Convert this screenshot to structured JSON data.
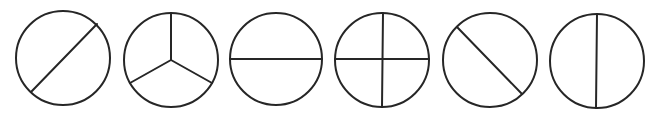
{
  "figure": {
    "background": "#ffffff",
    "stroke_color": "#262626",
    "stroke_width": 2
  },
  "circles": [
    {
      "id": "circle-1",
      "label": "circle divided by diagonal line (bottom-left to top-right), not through center",
      "cx": 63,
      "cy": 58,
      "r": 47,
      "lines": [
        {
          "x1": 31,
          "y1": 92,
          "x2": 97,
          "y2": 24
        }
      ]
    },
    {
      "id": "circle-2",
      "label": "circle divided into three equal parts",
      "cx": 171,
      "cy": 60,
      "r": 47,
      "lines": [
        {
          "x1": 171,
          "y1": 60,
          "x2": 171,
          "y2": 13
        },
        {
          "x1": 171,
          "y1": 60,
          "x2": 130,
          "y2": 83
        },
        {
          "x1": 171,
          "y1": 60,
          "x2": 212,
          "y2": 83
        }
      ]
    },
    {
      "id": "circle-3",
      "label": "circle divided in half by horizontal line",
      "cx": 276,
      "cy": 59,
      "r": 46,
      "lines": [
        {
          "x1": 230,
          "y1": 59,
          "x2": 322,
          "y2": 59
        }
      ]
    },
    {
      "id": "circle-4",
      "label": "circle divided into four equal parts",
      "cx": 382,
      "cy": 60,
      "r": 47,
      "lines": [
        {
          "x1": 335,
          "y1": 59,
          "x2": 429,
          "y2": 59
        },
        {
          "x1": 383,
          "y1": 13,
          "x2": 382,
          "y2": 107
        }
      ]
    },
    {
      "id": "circle-5",
      "label": "circle divided by diagonal line (top-left to bottom-right), not through center",
      "cx": 490,
      "cy": 60,
      "r": 47,
      "lines": [
        {
          "x1": 457,
          "y1": 27,
          "x2": 522,
          "y2": 94
        }
      ]
    },
    {
      "id": "circle-6",
      "label": "circle divided in half by vertical line",
      "cx": 597,
      "cy": 61,
      "r": 47,
      "lines": [
        {
          "x1": 597,
          "y1": 14,
          "x2": 596,
          "y2": 108
        }
      ]
    }
  ]
}
